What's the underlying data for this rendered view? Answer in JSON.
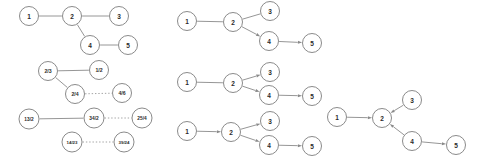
{
  "figure": {
    "background_color": "#ffffff",
    "edge_color": "#8a8a8a",
    "node_fill": "#ffffff",
    "node_stroke": "#7d7d7d",
    "label_color": "#2b2b2b"
  },
  "panels": [
    {
      "id": "panel-top-left",
      "name": "undirected-tree",
      "directed": false,
      "nodes": [
        {
          "id": "n1",
          "label": "1",
          "x": 29,
          "y": 16,
          "r": 9.5,
          "font_size": 6.5
        },
        {
          "id": "n2",
          "label": "2",
          "x": 72,
          "y": 16,
          "r": 9.5,
          "font_size": 6.5
        },
        {
          "id": "n3",
          "label": "3",
          "x": 119,
          "y": 16,
          "r": 9.5,
          "font_size": 6.5
        },
        {
          "id": "n4",
          "label": "4",
          "x": 90,
          "y": 45,
          "r": 9.5,
          "font_size": 6.5
        },
        {
          "id": "n5",
          "label": "5",
          "x": 128,
          "y": 45,
          "r": 9.5,
          "font_size": 6.5
        }
      ],
      "edges": [
        {
          "from": "n1",
          "to": "n2",
          "style": "solid",
          "arrow": false
        },
        {
          "from": "n2",
          "to": "n3",
          "style": "solid",
          "arrow": false
        },
        {
          "from": "n2",
          "to": "n4",
          "style": "solid",
          "arrow": false
        },
        {
          "from": "n4",
          "to": "n5",
          "style": "solid",
          "arrow": false
        }
      ]
    },
    {
      "id": "panel-bottom-left",
      "name": "fraction-labeled-graph",
      "directed": false,
      "nodes": [
        {
          "id": "f1",
          "label": "2/3",
          "x": 48,
          "y": 71,
          "r": 9.5,
          "font_size": 5.2
        },
        {
          "id": "f2",
          "label": "1/2",
          "x": 99,
          "y": 70,
          "r": 9.5,
          "font_size": 5.2
        },
        {
          "id": "f3",
          "label": "2/4",
          "x": 75,
          "y": 94,
          "r": 9.5,
          "font_size": 5.2
        },
        {
          "id": "f4",
          "label": "4/6",
          "x": 122,
          "y": 93,
          "r": 9.5,
          "font_size": 5.2
        },
        {
          "id": "f5",
          "label": "13/2",
          "x": 29,
          "y": 119,
          "r": 10,
          "font_size": 4.8
        },
        {
          "id": "f6",
          "label": "34/2",
          "x": 94,
          "y": 118,
          "r": 10,
          "font_size": 4.8
        },
        {
          "id": "f7",
          "label": "25/4",
          "x": 142,
          "y": 118,
          "r": 10,
          "font_size": 4.8
        },
        {
          "id": "f8",
          "label": "14/23",
          "x": 72,
          "y": 142,
          "r": 10,
          "font_size": 4.4
        },
        {
          "id": "f9",
          "label": "39/24",
          "x": 124,
          "y": 142,
          "r": 10,
          "font_size": 4.4
        }
      ],
      "edges": [
        {
          "from": "f1",
          "to": "f2",
          "style": "solid",
          "arrow": false
        },
        {
          "from": "f1",
          "to": "f3",
          "style": "solid",
          "arrow": false
        },
        {
          "from": "f3",
          "to": "f4",
          "style": "dotted",
          "arrow": false
        },
        {
          "from": "f5",
          "to": "f6",
          "style": "solid",
          "arrow": false
        },
        {
          "from": "f6",
          "to": "f7",
          "style": "dotted",
          "arrow": false
        },
        {
          "from": "f8",
          "to": "f9",
          "style": "dotted",
          "arrow": false
        }
      ]
    },
    {
      "id": "panel-middle-top",
      "name": "directed-graph-partial-a",
      "directed": true,
      "nodes": [
        {
          "id": "m1",
          "label": "1",
          "x": 187,
          "y": 21,
          "r": 9.5,
          "font_size": 6.5
        },
        {
          "id": "m2",
          "label": "2",
          "x": 233,
          "y": 22,
          "r": 9.5,
          "font_size": 6.5
        },
        {
          "id": "m3",
          "label": "3",
          "x": 270,
          "y": 11,
          "r": 9.5,
          "font_size": 6.5
        },
        {
          "id": "m4",
          "label": "4",
          "x": 269,
          "y": 41,
          "r": 9.5,
          "font_size": 6.5
        },
        {
          "id": "m5",
          "label": "5",
          "x": 312,
          "y": 43,
          "r": 9.5,
          "font_size": 6.5
        }
      ],
      "edges": [
        {
          "from": "m1",
          "to": "m2",
          "style": "solid",
          "arrow": false
        },
        {
          "from": "m2",
          "to": "m3",
          "style": "solid",
          "arrow": false
        },
        {
          "from": "m2",
          "to": "m4",
          "style": "solid",
          "arrow": true
        },
        {
          "from": "m4",
          "to": "m5",
          "style": "solid",
          "arrow": true
        }
      ]
    },
    {
      "id": "panel-middle-mid",
      "name": "directed-graph-partial-b",
      "directed": true,
      "nodes": [
        {
          "id": "p1",
          "label": "1",
          "x": 187,
          "y": 82,
          "r": 9.5,
          "font_size": 6.5
        },
        {
          "id": "p2",
          "label": "2",
          "x": 233,
          "y": 83,
          "r": 9.5,
          "font_size": 6.5
        },
        {
          "id": "p3",
          "label": "3",
          "x": 270,
          "y": 72,
          "r": 9.5,
          "font_size": 6.5
        },
        {
          "id": "p4",
          "label": "4",
          "x": 269,
          "y": 95,
          "r": 9.5,
          "font_size": 6.5
        },
        {
          "id": "p5",
          "label": "5",
          "x": 312,
          "y": 96,
          "r": 9.5,
          "font_size": 6.5
        }
      ],
      "edges": [
        {
          "from": "p1",
          "to": "p2",
          "style": "solid",
          "arrow": false
        },
        {
          "from": "p2",
          "to": "p3",
          "style": "solid",
          "arrow": true
        },
        {
          "from": "p2",
          "to": "p4",
          "style": "solid",
          "arrow": true
        },
        {
          "from": "p4",
          "to": "p5",
          "style": "solid",
          "arrow": true
        }
      ]
    },
    {
      "id": "panel-middle-bottom",
      "name": "directed-graph-full",
      "directed": true,
      "nodes": [
        {
          "id": "q1",
          "label": "1",
          "x": 187,
          "y": 131,
          "r": 9.5,
          "font_size": 6.5
        },
        {
          "id": "q2",
          "label": "2",
          "x": 231,
          "y": 132,
          "r": 9.5,
          "font_size": 6.5
        },
        {
          "id": "q3",
          "label": "3",
          "x": 270,
          "y": 121,
          "r": 9.5,
          "font_size": 6.5
        },
        {
          "id": "q4",
          "label": "4",
          "x": 269,
          "y": 145,
          "r": 9.5,
          "font_size": 6.5
        },
        {
          "id": "q5",
          "label": "5",
          "x": 312,
          "y": 146,
          "r": 9.5,
          "font_size": 6.5
        }
      ],
      "edges": [
        {
          "from": "q1",
          "to": "q2",
          "style": "solid",
          "arrow": true
        },
        {
          "from": "q2",
          "to": "q3",
          "style": "solid",
          "arrow": true
        },
        {
          "from": "q2",
          "to": "q4",
          "style": "solid",
          "arrow": true
        },
        {
          "from": "q4",
          "to": "q5",
          "style": "solid",
          "arrow": true
        }
      ]
    },
    {
      "id": "panel-right",
      "name": "converging-directed-graph",
      "directed": true,
      "nodes": [
        {
          "id": "r1",
          "label": "1",
          "x": 337,
          "y": 117,
          "r": 9.5,
          "font_size": 6.5
        },
        {
          "id": "r2",
          "label": "2",
          "x": 382,
          "y": 118,
          "r": 9.5,
          "font_size": 6.5
        },
        {
          "id": "r3",
          "label": "3",
          "x": 412,
          "y": 100,
          "r": 9.5,
          "font_size": 6.5
        },
        {
          "id": "r4",
          "label": "4",
          "x": 412,
          "y": 141,
          "r": 9.5,
          "font_size": 6.5
        },
        {
          "id": "r5",
          "label": "5",
          "x": 456,
          "y": 145,
          "r": 9.5,
          "font_size": 6.5
        }
      ],
      "edges": [
        {
          "from": "r1",
          "to": "r2",
          "style": "solid",
          "arrow": true
        },
        {
          "from": "r3",
          "to": "r2",
          "style": "solid",
          "arrow": true
        },
        {
          "from": "r4",
          "to": "r2",
          "style": "solid",
          "arrow": true
        },
        {
          "from": "r4",
          "to": "r5",
          "style": "solid",
          "arrow": true
        }
      ]
    }
  ]
}
